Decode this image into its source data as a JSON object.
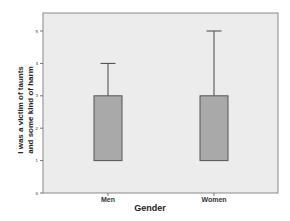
{
  "chart_data": {
    "type": "boxplot",
    "title": "",
    "xlabel": "Gender",
    "ylabel_lines": [
      "I was a victim of taunts",
      "and some kind of harm"
    ],
    "categories": [
      "Men",
      "Women"
    ],
    "yticks": [
      "0",
      "1",
      "2",
      "3",
      "4",
      "5"
    ],
    "ylim": [
      0,
      5.6
    ],
    "grid": false,
    "legend": null,
    "series": [
      {
        "name": "Men",
        "min": 1,
        "q1": 1,
        "median": 1,
        "q3": 3,
        "max": 4
      },
      {
        "name": "Women",
        "min": 1,
        "q1": 1,
        "median": 1,
        "q3": 3,
        "max": 5
      }
    ],
    "colors": {
      "plot_background": "#ececec",
      "box_fill": "#a9a9a9",
      "frame": "#8a8a8a",
      "lines": "#444444"
    }
  }
}
